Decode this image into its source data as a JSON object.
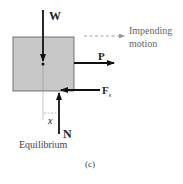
{
  "diagram": {
    "labels": {
      "weight": "W",
      "push": "P",
      "friction": "F",
      "friction_sub": "s",
      "normal": "N",
      "distance": "x",
      "impending_line1": "Impending",
      "impending_line2": "motion",
      "state": "Equilibrium",
      "caption": "(c)"
    },
    "colors": {
      "block_fill": "#c8c8c8",
      "block_stroke": "#555555",
      "arrow": "#111111",
      "dashed_arrow": "#888888"
    }
  }
}
